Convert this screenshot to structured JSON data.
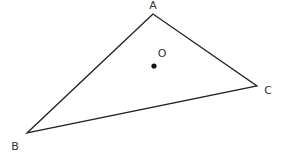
{
  "diagram": {
    "type": "geometry",
    "triangle": {
      "name": "ABC",
      "vertices": [
        {
          "label": "A",
          "x": 153,
          "y": 14,
          "label_x": 153,
          "label_y": 9,
          "anchor": "middle"
        },
        {
          "label": "B",
          "x": 27,
          "y": 133,
          "label_x": 15,
          "label_y": 150,
          "anchor": "middle"
        },
        {
          "label": "C",
          "x": 257,
          "y": 86,
          "label_x": 268,
          "label_y": 94,
          "anchor": "middle"
        }
      ],
      "stroke": "#222222"
    },
    "point": {
      "label": "O",
      "x": 154,
      "y": 66,
      "label_x": 162,
      "label_y": 57,
      "fill": "#111111"
    }
  }
}
